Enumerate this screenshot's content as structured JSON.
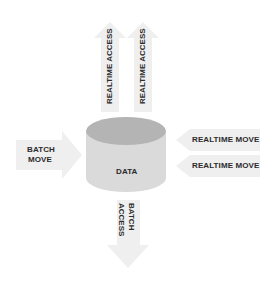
{
  "diagram": {
    "center": {
      "label": "DATA",
      "shape": "cylinder",
      "top_color": "#b3b3b3",
      "side_color": "#d9d9d9"
    },
    "arrows": [
      {
        "id": "up-1",
        "label": "REALTIME ACCESS",
        "direction": "up"
      },
      {
        "id": "up-2",
        "label": "REALTIME ACCESS",
        "direction": "up"
      },
      {
        "id": "left-in",
        "label_lines": [
          "BATCH",
          "MOVE"
        ],
        "direction": "right"
      },
      {
        "id": "right-in-1",
        "label": "REALTIME MOVE",
        "direction": "left"
      },
      {
        "id": "right-in-2",
        "label": "REALTIME MOVE",
        "direction": "left"
      },
      {
        "id": "down",
        "label_lines": [
          "BATCH",
          "ACCESS"
        ],
        "direction": "down"
      }
    ],
    "arrow_color": "#eeeeee",
    "text_color": "#2b2b2b"
  }
}
